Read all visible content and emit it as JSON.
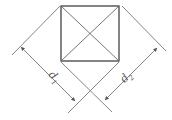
{
  "diagram": {
    "labels": {
      "d1": {
        "text": "d",
        "sub": "1"
      },
      "d2": {
        "text": "d",
        "sub": "2"
      }
    },
    "colors": {
      "square": "#333333",
      "lines": "#777777"
    }
  }
}
